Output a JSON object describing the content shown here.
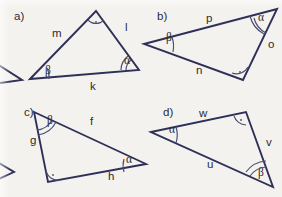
{
  "figure": {
    "background_color": "#f4f2ee",
    "line_color": "#2e3058",
    "text_color": "#2b2b33",
    "arc_color": "#4a4c72",
    "width": 282,
    "height": 197,
    "panels": [
      {
        "id": "a",
        "label": "a)",
        "label_x": 14,
        "label_y": 20,
        "vertices": {
          "left": {
            "x": 30,
            "y": 79
          },
          "apex": {
            "x": 96,
            "y": 11
          },
          "right": {
            "x": 139,
            "y": 70
          }
        },
        "sides": [
          {
            "name": "m",
            "x": 52,
            "y": 37
          },
          {
            "name": "l",
            "x": 125,
            "y": 31
          },
          {
            "name": "k",
            "x": 90,
            "y": 90
          }
        ],
        "angles": [
          {
            "name": "beta",
            "symbol": "β",
            "at": "left",
            "x": 45,
            "y": 74
          },
          {
            "name": "alpha",
            "symbol": "α",
            "at": "right",
            "x": 124,
            "y": 64
          },
          {
            "name": "right-angle",
            "symbol": "",
            "at": "apex",
            "x": 96,
            "y": 22
          }
        ]
      },
      {
        "id": "b",
        "label": "b)",
        "label_x": 157,
        "label_y": 20,
        "vertices": {
          "left": {
            "x": 144,
            "y": 44
          },
          "top": {
            "x": 277,
            "y": 9
          },
          "bottom": {
            "x": 243,
            "y": 80
          }
        },
        "sides": [
          {
            "name": "p",
            "x": 206,
            "y": 22
          },
          {
            "name": "o",
            "x": 268,
            "y": 48
          },
          {
            "name": "n",
            "x": 196,
            "y": 74
          }
        ],
        "angles": [
          {
            "name": "beta",
            "symbol": "β",
            "at": "left",
            "x": 166,
            "y": 41
          },
          {
            "name": "alpha",
            "symbol": "α",
            "at": "top",
            "x": 258,
            "y": 21
          },
          {
            "name": "right-angle",
            "symbol": "",
            "at": "bottom",
            "x": 243,
            "y": 80
          }
        ]
      },
      {
        "id": "c",
        "label": "c)",
        "label_x": 24,
        "label_y": 116,
        "vertices": {
          "top": {
            "x": 34,
            "y": 112
          },
          "bottom": {
            "x": 48,
            "y": 182
          },
          "right": {
            "x": 146,
            "y": 164
          }
        },
        "sides": [
          {
            "name": "f",
            "x": 90,
            "y": 125
          },
          {
            "name": "g",
            "x": 30,
            "y": 144
          },
          {
            "name": "h",
            "x": 108,
            "y": 180
          }
        ],
        "angles": [
          {
            "name": "beta",
            "symbol": "β",
            "at": "top",
            "x": 47,
            "y": 124
          },
          {
            "name": "alpha",
            "symbol": "α",
            "at": "right",
            "x": 126,
            "y": 163
          },
          {
            "name": "right-angle",
            "symbol": "",
            "at": "bottom",
            "x": 48,
            "y": 182
          }
        ]
      },
      {
        "id": "d",
        "label": "d)",
        "label_x": 163,
        "label_y": 116,
        "vertices": {
          "left": {
            "x": 151,
            "y": 132
          },
          "top": {
            "x": 246,
            "y": 112
          },
          "bottom": {
            "x": 273,
            "y": 187
          }
        },
        "sides": [
          {
            "name": "w",
            "x": 199,
            "y": 117
          },
          {
            "name": "v",
            "x": 266,
            "y": 146
          },
          {
            "name": "u",
            "x": 207,
            "y": 168
          }
        ],
        "angles": [
          {
            "name": "alpha",
            "symbol": "α",
            "at": "left",
            "x": 169,
            "y": 133
          },
          {
            "name": "beta",
            "symbol": "β",
            "at": "bottom",
            "x": 258,
            "y": 176
          },
          {
            "name": "right-angle",
            "symbol": "",
            "at": "top",
            "x": 246,
            "y": 112
          }
        ]
      }
    ]
  }
}
